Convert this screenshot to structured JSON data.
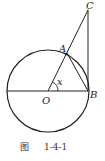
{
  "figure": {
    "caption_prefix": "图",
    "caption_number": "1-4-1",
    "points": {
      "A": "A",
      "B": "B",
      "C": "C",
      "O": "O"
    },
    "angle_label": "x",
    "stroke_color": "#222222"
  }
}
